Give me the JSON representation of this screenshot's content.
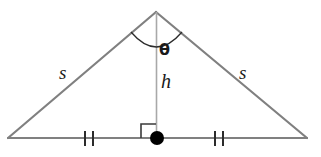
{
  "figure": {
    "background_color": "#ffffff",
    "line_color": "#808080",
    "thin_line_color": "#a8a8a8",
    "mark_color": "#3a3a3a",
    "dot_color": "#000000",
    "label_color": "#1a1a1a"
  },
  "labels": {
    "side_left": "s",
    "side_right": "s",
    "height": "h",
    "angle": "θ"
  },
  "geometry": {
    "apex": {
      "x": 156,
      "y": 12
    },
    "base_left": {
      "x": 8,
      "y": 138
    },
    "base_right": {
      "x": 307,
      "y": 138
    },
    "foot": {
      "x": 156,
      "y": 138
    },
    "altitude": {
      "from_y": 12,
      "to_y": 138
    },
    "angle_arc": {
      "start": {
        "x": 131,
        "y": 32
      },
      "end": {
        "x": 182,
        "y": 32
      },
      "sweep_low_y": 48
    },
    "right_angle_square": {
      "x": 141,
      "y": 124,
      "size": 14
    },
    "midpoint_dot": {
      "x": 157,
      "y": 138,
      "radius": 7
    },
    "tick_marks_left": [
      {
        "x": 85,
        "y_top": 131,
        "y_bottom": 146
      },
      {
        "x": 93,
        "y_top": 131,
        "y_bottom": 146
      }
    ],
    "tick_marks_right": [
      {
        "x": 215,
        "y_top": 131,
        "y_bottom": 146
      },
      {
        "x": 223,
        "y_top": 131,
        "y_bottom": 146
      }
    ]
  }
}
